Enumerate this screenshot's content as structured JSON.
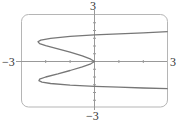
{
  "chart_data": {
    "type": "line",
    "title": "",
    "xlabel": "",
    "ylabel": "",
    "xlim": [
      -3,
      3
    ],
    "ylim": [
      -3,
      3
    ],
    "grid": false,
    "x_tick_step": 1,
    "y_tick_step": 0.5,
    "axis_labels": {
      "x_min": "−3",
      "x_max": "3",
      "y_min": "−3",
      "y_max": "3"
    },
    "series": [
      {
        "name": "curve",
        "points": [
          [
            3.0,
            1.92
          ],
          [
            2.0,
            1.85
          ],
          [
            1.0,
            1.78
          ],
          [
            0.0,
            1.72
          ],
          [
            -1.0,
            1.62
          ],
          [
            -1.8,
            1.5
          ],
          [
            -2.2,
            1.38
          ],
          [
            -2.32,
            1.28
          ],
          [
            -2.25,
            1.15
          ],
          [
            -2.0,
            1.02
          ],
          [
            -1.5,
            0.82
          ],
          [
            -1.0,
            0.6
          ],
          [
            -0.5,
            0.36
          ],
          [
            -0.15,
            0.15
          ],
          [
            0.0,
            0.0
          ],
          [
            -0.15,
            -0.15
          ],
          [
            -0.5,
            -0.34
          ],
          [
            -1.0,
            -0.58
          ],
          [
            -1.5,
            -0.8
          ],
          [
            -2.0,
            -1.0
          ],
          [
            -2.25,
            -1.14
          ],
          [
            -2.28,
            -1.24
          ],
          [
            -2.15,
            -1.33
          ],
          [
            -1.8,
            -1.42
          ],
          [
            -1.0,
            -1.52
          ],
          [
            0.0,
            -1.6
          ],
          [
            1.0,
            -1.66
          ],
          [
            2.0,
            -1.71
          ],
          [
            3.0,
            -1.75
          ]
        ],
        "color": "#777777"
      }
    ]
  }
}
